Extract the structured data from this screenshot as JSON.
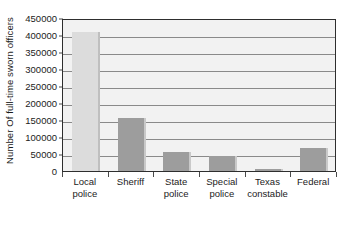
{
  "chart_data": {
    "type": "bar",
    "title": "",
    "xlabel": "",
    "ylabel": "Number Of full-time sworn officers",
    "categories": [
      "Local police",
      "Sheriff",
      "State police",
      "Special police",
      "Texas constable",
      "Federal"
    ],
    "category_lines": [
      [
        "Local",
        "police"
      ],
      [
        "Sheriff"
      ],
      [
        "State",
        "police"
      ],
      [
        "Special",
        "police"
      ],
      [
        "Texas",
        "constable"
      ],
      [
        "Federal"
      ]
    ],
    "values": [
      410000,
      155000,
      57000,
      45000,
      5000,
      67000
    ],
    "ylim": [
      0,
      450000
    ],
    "ytick_values": [
      0,
      50000,
      100000,
      150000,
      200000,
      250000,
      300000,
      350000,
      400000,
      450000
    ],
    "ytick_labels": [
      "0",
      "50000",
      "100000",
      "150000",
      "200000",
      "250000",
      "300000",
      "350000",
      "400000",
      "450000"
    ],
    "grid": true,
    "legend": false,
    "legend_position": "none",
    "colors": {
      "bar": "#9d9d9d",
      "bar_highlight": "#dcdcdc",
      "plot_background": "#f2f2f2",
      "gridline": "#8a8a8a",
      "axis": "#2e2e2e",
      "text": "#1b1b1b"
    },
    "highlight_index": 0
  }
}
